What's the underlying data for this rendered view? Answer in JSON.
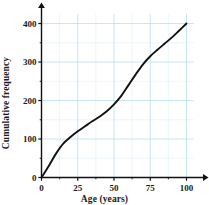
{
  "chart_data": {
    "type": "line",
    "title": "",
    "xlabel": "Age (years)",
    "ylabel": "Cumulative frequency",
    "xlim": [
      0,
      110
    ],
    "ylim": [
      0,
      430
    ],
    "xticks": [
      0,
      25,
      50,
      75,
      100
    ],
    "yticks": [
      0,
      100,
      200,
      300,
      400
    ],
    "xtick_labels": [
      "0",
      "25",
      "50",
      "75",
      "100"
    ],
    "ytick_labels": [
      "0",
      "100",
      "200",
      "300",
      "400"
    ],
    "grid": true,
    "grid_major_x_step": 25,
    "grid_minor_x_step": 12.5,
    "grid_major_y_step": 100,
    "grid_minor_y_step": 50,
    "grid_color": "#bfe3ee",
    "grid_minor_color": "#dff0f6",
    "legend": null,
    "series": [
      {
        "name": "Cumulative frequency ogive",
        "color": "#111111",
        "x": [
          0,
          5,
          10,
          15,
          20,
          25,
          30,
          35,
          40,
          45,
          50,
          55,
          60,
          65,
          70,
          75,
          80,
          85,
          90,
          95,
          100
        ],
        "y": [
          0,
          30,
          62,
          88,
          105,
          120,
          133,
          146,
          158,
          172,
          190,
          212,
          240,
          268,
          294,
          315,
          332,
          348,
          364,
          382,
          400
        ]
      }
    ]
  },
  "axes": {
    "x_axis_name": "x-axis",
    "y_axis_name": "y-axis",
    "arrow_x": "x-axis-arrow",
    "arrow_y": "y-axis-arrow"
  }
}
